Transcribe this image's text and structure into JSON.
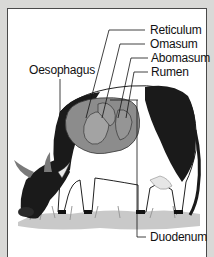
{
  "diagram": {
    "labels": [
      {
        "id": "reticulum",
        "text": "Reticulum"
      },
      {
        "id": "omasum",
        "text": "Omasum"
      },
      {
        "id": "abomasum",
        "text": "Abomasum"
      },
      {
        "id": "rumen",
        "text": "Rumen"
      },
      {
        "id": "oesophagus",
        "text": "Oesophagus"
      },
      {
        "id": "duodenum",
        "text": "Duodenum"
      }
    ],
    "colors": {
      "background": "#d9d9d7",
      "panel": "#ffffff",
      "stomach": "#8c8c8c",
      "cow_dark": "#1a1a1a",
      "grass": "#b5b5b5"
    }
  }
}
